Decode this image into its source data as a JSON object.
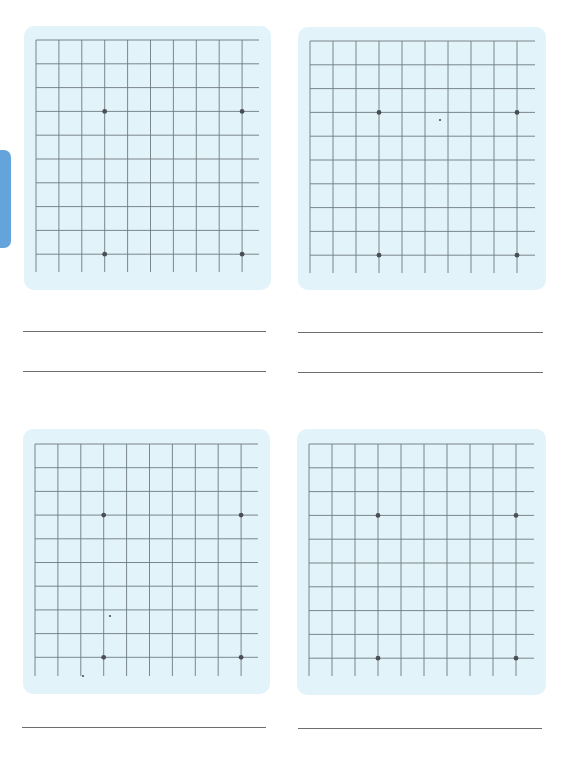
{
  "page": {
    "background": "#ffffff",
    "side_tab": {
      "color": "#5d9fd8",
      "label": ""
    }
  },
  "style": {
    "panel_color": "#e2f3fa",
    "grid_color": "#6f7b80",
    "dot_color": "#4a4f55",
    "answer_line_color": "#6d6d6d"
  },
  "grids": [
    {
      "id": "grid-1",
      "panel": {
        "x": 24,
        "y": 26,
        "w": 247,
        "h": 264
      },
      "origin": {
        "x": 12,
        "y": 14
      },
      "columns": 10,
      "rows": 10,
      "cell_w": 22.9,
      "cell_h": 23.8,
      "h_line_length": 223,
      "v_line_length": 232,
      "dots": [
        {
          "col": 3,
          "row": 3
        },
        {
          "col": 9,
          "row": 3
        },
        {
          "col": 3,
          "row": 9
        },
        {
          "col": 9,
          "row": 9
        }
      ],
      "specks": []
    },
    {
      "id": "grid-2",
      "panel": {
        "x": 298,
        "y": 27,
        "w": 248,
        "h": 263
      },
      "origin": {
        "x": 12,
        "y": 14
      },
      "columns": 10,
      "rows": 10,
      "cell_w": 23.0,
      "cell_h": 23.8,
      "h_line_length": 225,
      "v_line_length": 232,
      "dots": [
        {
          "col": 3,
          "row": 3
        },
        {
          "col": 9,
          "row": 3
        },
        {
          "col": 3,
          "row": 9
        },
        {
          "col": 9,
          "row": 9
        }
      ],
      "specks": [
        {
          "x": 142,
          "y": 93
        }
      ]
    },
    {
      "id": "grid-3",
      "panel": {
        "x": 23,
        "y": 429,
        "w": 247,
        "h": 265
      },
      "origin": {
        "x": 12,
        "y": 15
      },
      "columns": 10,
      "rows": 10,
      "cell_w": 22.9,
      "cell_h": 23.7,
      "h_line_length": 223,
      "v_line_length": 232,
      "dots": [
        {
          "col": 3,
          "row": 3
        },
        {
          "col": 9,
          "row": 3
        },
        {
          "col": 3,
          "row": 9
        },
        {
          "col": 9,
          "row": 9
        }
      ],
      "specks": [
        {
          "x": 87,
          "y": 187
        },
        {
          "x": 60,
          "y": 247
        }
      ]
    },
    {
      "id": "grid-4",
      "panel": {
        "x": 297,
        "y": 429,
        "w": 249,
        "h": 266
      },
      "origin": {
        "x": 12,
        "y": 15
      },
      "columns": 10,
      "rows": 10,
      "cell_w": 23.0,
      "cell_h": 23.8,
      "h_line_length": 225,
      "v_line_length": 232,
      "dots": [
        {
          "col": 3,
          "row": 3
        },
        {
          "col": 9,
          "row": 3
        },
        {
          "col": 3,
          "row": 9
        },
        {
          "col": 9,
          "row": 9
        }
      ],
      "specks": []
    }
  ],
  "answer_lines": [
    {
      "x": 23,
      "y": 331,
      "w": 243
    },
    {
      "x": 23,
      "y": 371,
      "w": 243
    },
    {
      "x": 298,
      "y": 332,
      "w": 245
    },
    {
      "x": 298,
      "y": 372,
      "w": 245
    },
    {
      "x": 22,
      "y": 727,
      "w": 244
    },
    {
      "x": 298,
      "y": 728,
      "w": 244
    }
  ]
}
